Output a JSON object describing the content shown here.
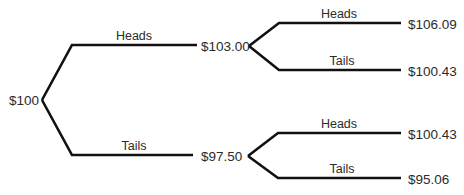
{
  "diagram": {
    "type": "binomial-tree",
    "root": {
      "value": "$100",
      "children": [
        {
          "edge_label": "Heads",
          "value": "$103.00",
          "children": [
            {
              "edge_label": "Heads",
              "value": "$106.09"
            },
            {
              "edge_label": "Tails",
              "value": "$100.43"
            }
          ]
        },
        {
          "edge_label": "Tails",
          "value": "$97.50",
          "children": [
            {
              "edge_label": "Heads",
              "value": "$100.43"
            },
            {
              "edge_label": "Tails",
              "value": "$95.06"
            }
          ]
        }
      ]
    },
    "colors": {
      "line": "#111111",
      "text": "#2b2b2b",
      "background": "#ffffff"
    }
  }
}
